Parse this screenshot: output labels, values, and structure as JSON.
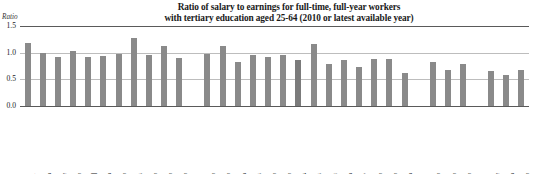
{
  "chart_data": {
    "type": "bar",
    "title": "Ratio of salary to earnings for full-time, full-year workers with tertiary education aged 25-64 (2010 or latest available year)",
    "title_line1": "Ratio of salary to earnings for full-time, full-year workers",
    "title_line2": "with tertiary education aged 25-64 (2010 or latest available year)",
    "ylabel": "Ratio",
    "xlabel": "",
    "ylim": [
      0.0,
      1.5
    ],
    "yticks": [
      "0.0",
      "0.5",
      "1.0",
      "1.5"
    ],
    "ytick_values": [
      0.0,
      0.5,
      1.0,
      1.5
    ],
    "grid": true,
    "legend": "none",
    "bar_color": "#8a8a8a",
    "oecd_bar_color": "#7b7b7b",
    "categories": [
      "Luxembourg",
      "Germany",
      "Netherlands",
      "Canada",
      "Ireland",
      "Denmark",
      "Scotland",
      "Spain",
      "Australia",
      "Korea",
      "United States",
      "Austria",
      "England",
      "Belgium (Fl.)",
      "Belgium (Fr.)",
      "New Zealand",
      "Finland",
      "OECD average",
      "Portugal",
      "Norway",
      "France",
      "Italy",
      "Sweden",
      "Slovenia",
      "Iceland",
      "Israel",
      "Czech Republic",
      "Poland",
      "Hungary",
      "Slovak Republic",
      "Estonia"
    ],
    "category_footnotes": [
      "1",
      "4",
      "2",
      "3",
      "",
      "4",
      "3",
      "4, 5",
      "3",
      "3",
      "3",
      "3",
      "3",
      "4",
      "4, 5",
      "3",
      "3",
      "4, 5",
      "4, 5",
      "6",
      "4",
      "",
      "3",
      "3",
      "4",
      "3",
      "3",
      "3",
      "2",
      "4",
      "3"
    ],
    "values": [
      1.18,
      1.0,
      0.92,
      1.03,
      0.92,
      0.93,
      0.98,
      1.27,
      0.95,
      1.12,
      0.9,
      0.97,
      1.13,
      0.83,
      0.95,
      0.92,
      0.95,
      0.87,
      1.17,
      0.78,
      0.86,
      0.74,
      0.88,
      0.88,
      0.62,
      0.82,
      0.68,
      0.79,
      0.66,
      0.58,
      0.67
    ],
    "group_breaks_after": [
      10,
      24,
      27
    ],
    "highlight_category": "OECD average"
  }
}
